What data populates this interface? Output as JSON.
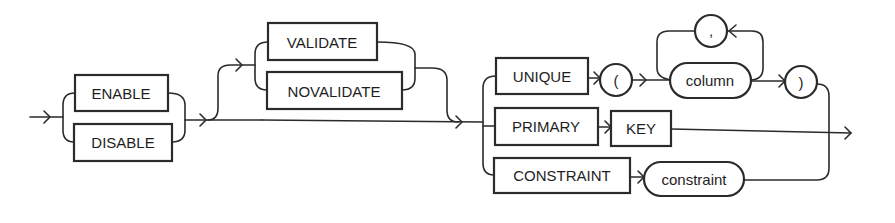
{
  "diagram": {
    "type": "railroad-syntax-diagram",
    "keywords": {
      "enable": "ENABLE",
      "disable": "DISABLE",
      "validate": "VALIDATE",
      "novalidate": "NOVALIDATE",
      "unique": "UNIQUE",
      "primary": "PRIMARY",
      "key": "KEY",
      "constraint_kw": "CONSTRAINT"
    },
    "symbols": {
      "open_paren": "(",
      "close_paren": ")",
      "comma": ","
    },
    "variables": {
      "column": "column",
      "constraint": "constraint"
    },
    "colors": {
      "stroke": "#2b2b2b",
      "background": "#ffffff",
      "text": "#1e1e1e"
    }
  }
}
